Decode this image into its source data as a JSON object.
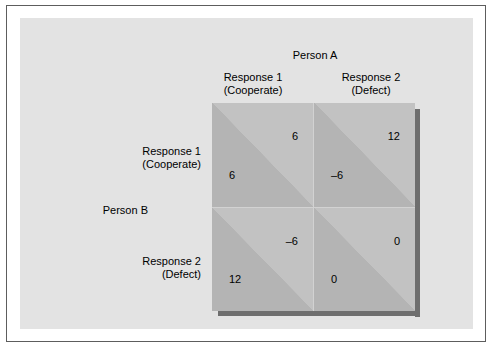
{
  "figure": {
    "column_axis_title": "Person A",
    "row_axis_title": "Person B",
    "columns": [
      {
        "label": "Response 1\n(Cooperate)"
      },
      {
        "label": "Response 2\n(Defect)"
      }
    ],
    "rows": [
      {
        "label": "Response 1\n(Cooperate)"
      },
      {
        "label": "Response 2\n(Defect)"
      }
    ]
  },
  "chart_data": {
    "type": "table",
    "title": "Person A",
    "xlabel": "Person A",
    "ylabel": "Person B",
    "col_categories": [
      "Response 1 (Cooperate)",
      "Response 2 (Defect)"
    ],
    "row_categories": [
      "Response 1 (Cooperate)",
      "Response 2 (Defect)"
    ],
    "cell_note": "Each cell is split by a diagonal; the upper-right triangle holds Person A's payoff and the lower-left triangle holds Person B's payoff.",
    "cells": [
      {
        "row": "Response 1 (Cooperate)",
        "col": "Response 1 (Cooperate)",
        "person_a": "6",
        "person_b": "6"
      },
      {
        "row": "Response 1 (Cooperate)",
        "col": "Response 2 (Defect)",
        "person_a": "12",
        "person_b": "–6"
      },
      {
        "row": "Response 2 (Defect)",
        "col": "Response 1 (Cooperate)",
        "person_a": "–6",
        "person_b": "12"
      },
      {
        "row": "Response 2 (Defect)",
        "col": "Response 2 (Defect)",
        "person_a": "0",
        "person_b": "0"
      }
    ],
    "colors": {
      "page_background": "#ffffff",
      "panel_background": "#e3e3e3",
      "cell_light_triangle": "#c2c2c2",
      "cell_dark_triangle": "#b4b4b4",
      "grid_line": "#d2d2d2",
      "drop_shadow": "#6e6e6e",
      "frame_border": "#5d5d5d",
      "text": "#000000"
    }
  }
}
